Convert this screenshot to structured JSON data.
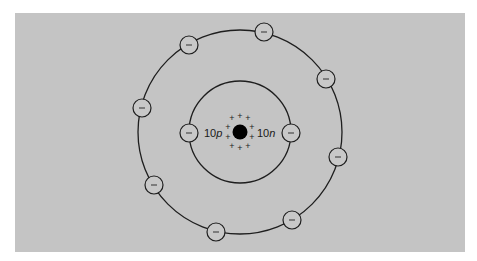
{
  "diagram": {
    "type": "bohr-atom-model",
    "background_color": "#c4c4c4",
    "stroke_color": "#1e1e1e",
    "nucleus": {
      "protons_label": {
        "count": "10",
        "symbol": "p"
      },
      "neutrons_label": {
        "count": "10",
        "symbol": "n"
      },
      "charge_symbols": [
        "+",
        "+",
        "+",
        "+",
        "+",
        "+",
        "+",
        "+",
        "+",
        "+"
      ]
    },
    "shells": [
      {
        "name": "inner-shell",
        "electron_count": 2,
        "electron_symbol": "−"
      },
      {
        "name": "outer-shell",
        "electron_count": 8,
        "electron_symbol": "−"
      }
    ],
    "electron_symbol": "−"
  }
}
